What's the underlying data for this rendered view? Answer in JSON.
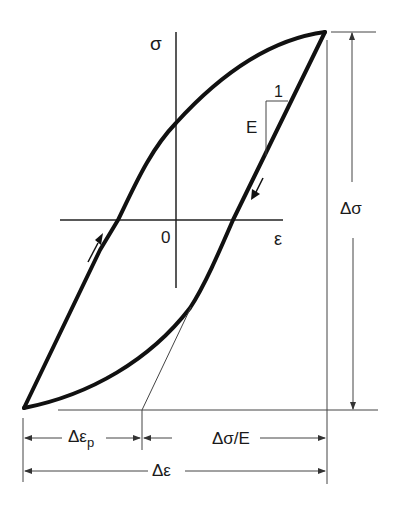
{
  "diagram": {
    "colors": {
      "curve": "#111111",
      "axis": "#222222",
      "dim": "#333333",
      "background": "#ffffff"
    },
    "axes": {
      "sigma_label": "σ",
      "epsilon_label": "ε",
      "origin_label": "0",
      "sigma_axis": {
        "x": 176,
        "y1": 32,
        "y2": 288
      },
      "epsilon_axis": {
        "y": 220,
        "x1": 60,
        "x2": 283
      }
    },
    "loop": {
      "top_tip": [
        325,
        32
      ],
      "bottom_tip": [
        24,
        408
      ],
      "upper_branch": "M 24 408 L 100 250 L 118 220 C 135 185 150 150 176 123 C 215 80 265 40 325 32",
      "lower_branch": "M 325 32 L 233 220 C 220 250 205 285 190 308 C 150 360 90 395 24 408"
    },
    "slope_triangle": {
      "label_one": "1",
      "label_E": "E"
    },
    "dimensions": {
      "delta_sigma": "Δσ",
      "delta_epsilon_p": "Δε",
      "delta_epsilon_p_sub": "p",
      "delta_sigma_over_E": "Δσ/E",
      "delta_epsilon": "Δε"
    }
  }
}
